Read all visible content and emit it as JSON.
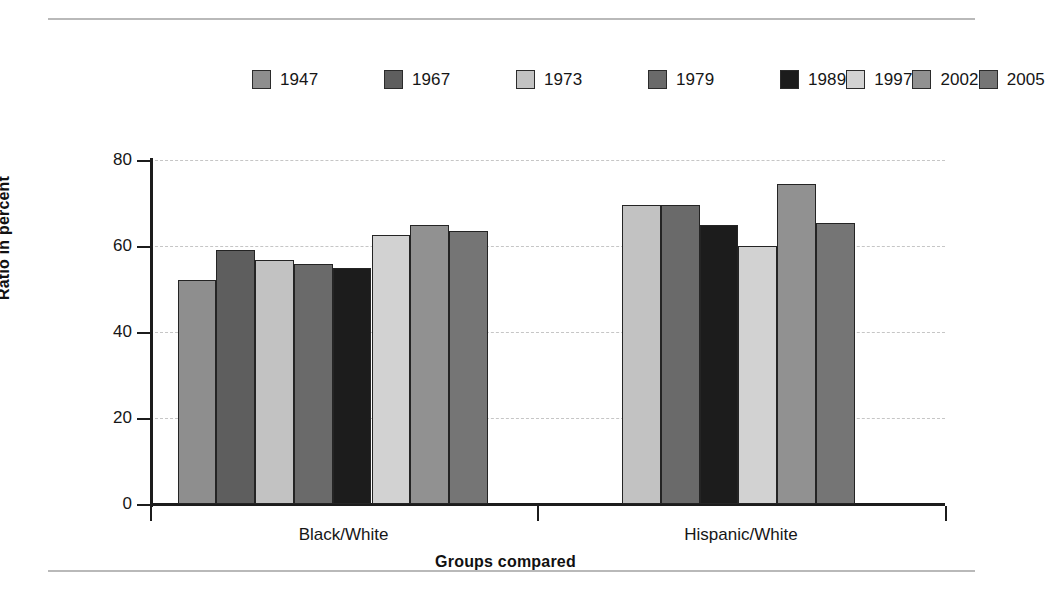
{
  "chart_data": {
    "type": "bar",
    "title": "",
    "xlabel": "Groups compared",
    "ylabel": "Ratio in percent",
    "ylim": [
      0,
      80
    ],
    "yticks": [
      "0",
      "20",
      "40",
      "60",
      "80"
    ],
    "grid": true,
    "legend_position": "top",
    "categories": [
      "Black/White",
      "Hispanic/White"
    ],
    "series": [
      {
        "name": "1947",
        "color": "#8e8e8e",
        "values": [
          52.0,
          null
        ]
      },
      {
        "name": "1967",
        "color": "#5e5e5e",
        "values": [
          59.0,
          null
        ]
      },
      {
        "name": "1973",
        "color": "#c2c2c2",
        "values": [
          56.8,
          69.6
        ]
      },
      {
        "name": "1979",
        "color": "#6a6a6a",
        "values": [
          55.8,
          69.5
        ]
      },
      {
        "name": "1989",
        "color": "#1c1c1c",
        "values": [
          55.0,
          65.0
        ]
      },
      {
        "name": "1997",
        "color": "#d2d2d2",
        "values": [
          62.5,
          60.0
        ]
      },
      {
        "name": "2002",
        "color": "#919191",
        "values": [
          64.8,
          74.5
        ]
      },
      {
        "name": "2005",
        "color": "#757575",
        "values": [
          63.4,
          65.4
        ]
      }
    ]
  },
  "legend": {
    "entries": [
      {
        "label": "1947",
        "color": "#8e8e8e"
      },
      {
        "label": "1967",
        "color": "#5e5e5e"
      },
      {
        "label": "1973",
        "color": "#c2c2c2"
      },
      {
        "label": "1979",
        "color": "#6a6a6a"
      },
      {
        "label": "1989",
        "color": "#1c1c1c"
      },
      {
        "label": "1997",
        "color": "#d2d2d2"
      },
      {
        "label": "2002",
        "color": "#919191"
      },
      {
        "label": "2005",
        "color": "#757575"
      }
    ]
  },
  "axes": {
    "y_title": "Ratio in percent",
    "x_title": "Groups compared",
    "y_ticks": [
      "80",
      "60",
      "40",
      "20",
      "0"
    ],
    "x_categories": [
      "Black/White",
      "Hispanic/White"
    ]
  }
}
